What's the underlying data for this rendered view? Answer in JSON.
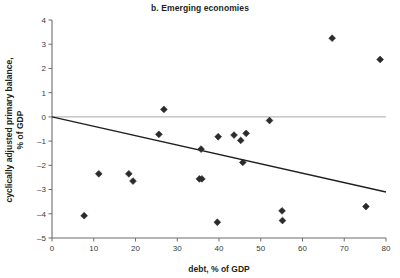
{
  "chart_data": {
    "type": "scatter",
    "title": "b. Emerging economies",
    "xlabel": "debt, % of GDP",
    "ylabel": "cyclically adjusted primary balance,\n% of GDP",
    "ylabel_line1": "cyclically adjusted primary balance,",
    "ylabel_line2": "% of GDP",
    "xlim": [
      0,
      80
    ],
    "ylim": [
      -5,
      4
    ],
    "xticks": [
      0,
      10,
      20,
      30,
      40,
      50,
      60,
      70,
      80
    ],
    "xtick_labels": [
      "0",
      "10",
      "20",
      "30",
      "40",
      "50",
      "60",
      "70",
      "80"
    ],
    "yticks": [
      -5,
      -4,
      -3,
      -2,
      -1,
      0,
      1,
      2,
      3,
      4
    ],
    "ytick_labels": [
      "–5",
      "–4",
      "–3",
      "–2",
      "–1",
      "0",
      "1",
      "2",
      "3",
      "4"
    ],
    "grid": false,
    "legend": null,
    "marker": "diamond",
    "marker_color": "#2b2b2b",
    "points": [
      {
        "x": 7.7,
        "y": -4.08
      },
      {
        "x": 11.2,
        "y": -2.35
      },
      {
        "x": 18.4,
        "y": -2.35
      },
      {
        "x": 19.4,
        "y": -2.65
      },
      {
        "x": 25.6,
        "y": -0.72
      },
      {
        "x": 26.8,
        "y": 0.31
      },
      {
        "x": 35.3,
        "y": -2.56
      },
      {
        "x": 35.9,
        "y": -2.56
      },
      {
        "x": 35.7,
        "y": -1.33
      },
      {
        "x": 39.6,
        "y": -4.35
      },
      {
        "x": 39.8,
        "y": -0.82
      },
      {
        "x": 43.6,
        "y": -0.75
      },
      {
        "x": 45.2,
        "y": -0.97
      },
      {
        "x": 45.7,
        "y": -1.88
      },
      {
        "x": 46.5,
        "y": -0.68
      },
      {
        "x": 52.1,
        "y": -0.15
      },
      {
        "x": 55.1,
        "y": -3.88
      },
      {
        "x": 55.2,
        "y": -4.28
      },
      {
        "x": 67.1,
        "y": 3.25
      },
      {
        "x": 75.2,
        "y": -3.7
      },
      {
        "x": 78.6,
        "y": 2.37
      }
    ],
    "reference_line": {
      "name": "zero-line",
      "y": 0,
      "color": "#a8a8a8"
    },
    "trend_line": {
      "name": "fitted-trend-line",
      "x_start": 0,
      "y_start": 0.0,
      "x_end": 80,
      "y_end": -3.1,
      "color": "#231f20"
    }
  }
}
